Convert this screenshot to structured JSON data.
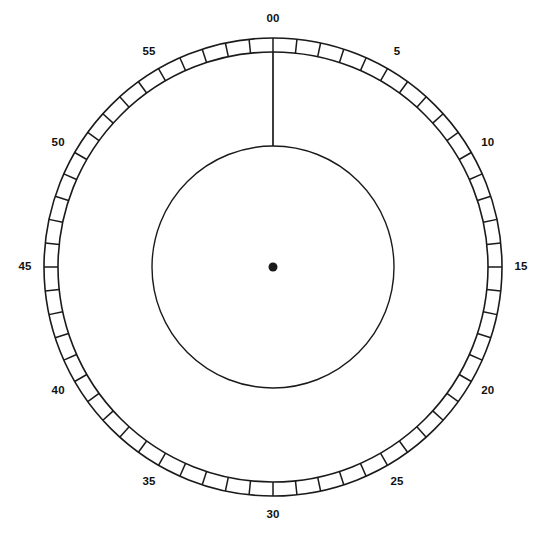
{
  "figure": {
    "kind": "analog-dial-gauge",
    "width": 547,
    "height": 534,
    "background_color": "#ffffff",
    "stroke_color": "#1a1a1a"
  },
  "dial": {
    "center_x": 273,
    "center_y": 267,
    "outer_ring_radius": 229,
    "inner_ring_radius": 215,
    "inner_circle_radius": 121,
    "label_radius": 248,
    "tick_count": 60,
    "major_tick_interval": 5,
    "hub_dot_radius": 4.5,
    "hand_value": "00",
    "hand_angle_deg": 0,
    "hand_tail_radius": 121,
    "hand_tip_radius": 215
  },
  "labels": [
    {
      "text": "00",
      "value": 0,
      "angle_deg": 0
    },
    {
      "text": "5",
      "value": 5,
      "angle_deg": 30
    },
    {
      "text": "10",
      "value": 10,
      "angle_deg": 60
    },
    {
      "text": "15",
      "value": 15,
      "angle_deg": 90
    },
    {
      "text": "20",
      "value": 20,
      "angle_deg": 120
    },
    {
      "text": "25",
      "value": 25,
      "angle_deg": 150
    },
    {
      "text": "30",
      "value": 30,
      "angle_deg": 180
    },
    {
      "text": "35",
      "value": 35,
      "angle_deg": 210
    },
    {
      "text": "40",
      "value": 40,
      "angle_deg": 240
    },
    {
      "text": "45",
      "value": 45,
      "angle_deg": 270
    },
    {
      "text": "50",
      "value": 50,
      "angle_deg": 300
    },
    {
      "text": "55",
      "value": 55,
      "angle_deg": 330
    }
  ],
  "chart_data": {
    "type": "gauge",
    "title": "",
    "scale_min": 0,
    "scale_max": 60,
    "tick_step": 1,
    "label_step": 5,
    "tick_labels": [
      "00",
      "5",
      "10",
      "15",
      "20",
      "25",
      "30",
      "35",
      "40",
      "45",
      "50",
      "55"
    ],
    "pointer_value": 0,
    "pointer_label": "00",
    "direction": "clockwise",
    "zero_position": "top",
    "grid": false,
    "legend": "none"
  }
}
